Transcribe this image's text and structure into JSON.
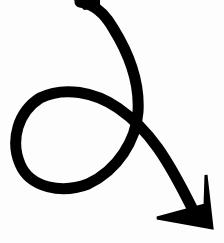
{
  "image": {
    "subject": "hand-drawn curly arrow",
    "stroke_color": "#000000",
    "background_color": "#fdfdfd"
  }
}
